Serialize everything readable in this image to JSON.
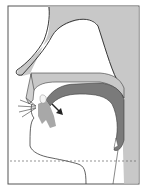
{
  "diagram": {
    "type": "sagittal-vocal-tract",
    "colors": {
      "background": "#ffffff",
      "frame": "#555555",
      "light_tissue": "#c8c8c8",
      "tongue": "#7a7a7a",
      "outline": "#3a3a3a",
      "dashed_line": "#666666",
      "arrow": "#222222"
    },
    "elements": [
      {
        "name": "nasal-cavity-wall"
      },
      {
        "name": "nose-outline"
      },
      {
        "name": "hard-palate"
      },
      {
        "name": "tongue"
      },
      {
        "name": "lips"
      },
      {
        "name": "airflow-arrow"
      },
      {
        "name": "pharynx-wall"
      },
      {
        "name": "glottis-level-line"
      }
    ]
  }
}
